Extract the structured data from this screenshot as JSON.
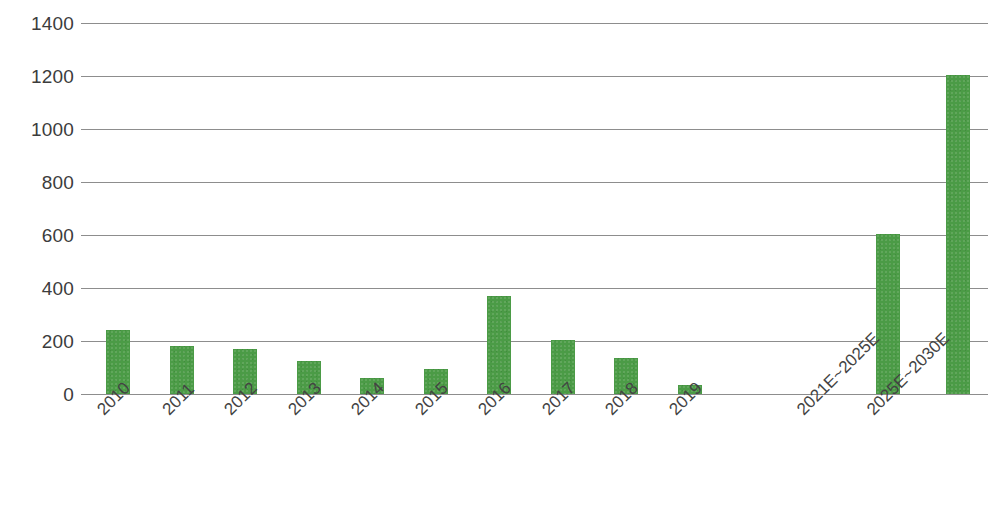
{
  "chart_data": {
    "type": "bar",
    "title": "",
    "subtitle": "",
    "xlabel": "",
    "ylabel": "",
    "categories": [
      "2010",
      "2011",
      "2012",
      "2013",
      "2014",
      "2015",
      "2016",
      "2017",
      "2018",
      "2019",
      "2021E~2025E",
      "2025E~2030E"
    ],
    "values": [
      240,
      180,
      170,
      125,
      62,
      95,
      370,
      205,
      135,
      35,
      605,
      1205
    ],
    "series": [
      {
        "name": "",
        "values": [
          240,
          180,
          170,
          125,
          62,
          95,
          370,
          205,
          135,
          35,
          605,
          1205
        ],
        "color": "#4b9b46"
      }
    ],
    "ylim": [
      0,
      1400
    ],
    "ytick_values": [
      0,
      200,
      400,
      600,
      800,
      1000,
      1200,
      1400
    ],
    "ytick_labels": [
      "0",
      "200",
      "400",
      "600",
      "800",
      "1000",
      "1200",
      "1400"
    ],
    "grid": true,
    "grid_axis": "y",
    "grid_color": "#8d8d8d",
    "legend": false,
    "legend_position": "none",
    "bar_color": "#4b9b46",
    "background_color": "#ffffff",
    "xtick_rotation": -45,
    "gap_after_index": 9
  }
}
